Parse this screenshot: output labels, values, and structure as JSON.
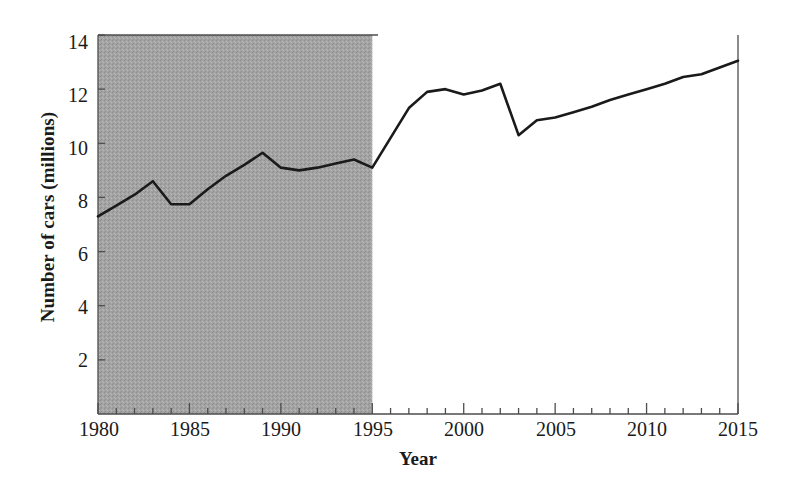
{
  "chart_data": {
    "type": "line",
    "title": "",
    "xlabel": "Year",
    "ylabel": "Number of cars (millions)",
    "xlim": [
      1980,
      2015
    ],
    "ylim": [
      0,
      14
    ],
    "xticks": [
      1980,
      1985,
      1990,
      1995,
      2000,
      2005,
      2010,
      2015
    ],
    "xticklabels": [
      "1980",
      "1985",
      "1990",
      "1995",
      "2000",
      "2005",
      "2010",
      "2015"
    ],
    "xminortick_interval": 1,
    "yticks": [
      2,
      4,
      6,
      8,
      10,
      12,
      14
    ],
    "yticklabels": [
      "2",
      "4",
      "6",
      "8",
      "10",
      "12",
      "14"
    ],
    "grid": false,
    "legend": null,
    "series": [
      {
        "name": "Number of cars",
        "color": "#1a1a1a",
        "linewidth": 2.6,
        "x": [
          1980,
          1981,
          1982,
          1983,
          1984,
          1985,
          1986,
          1987,
          1988,
          1989,
          1990,
          1991,
          1992,
          1993,
          1994,
          1995,
          1996,
          1997,
          1998,
          1999,
          2000,
          2001,
          2002,
          2003,
          2004,
          2005,
          2006,
          2007,
          2008,
          2009,
          2010,
          2011,
          2012,
          2013,
          2014,
          2015
        ],
        "values": [
          7.3,
          7.7,
          8.1,
          8.6,
          7.75,
          7.75,
          8.3,
          8.8,
          9.2,
          9.65,
          9.1,
          9.0,
          9.1,
          9.25,
          9.4,
          9.1,
          10.2,
          11.3,
          11.9,
          12.0,
          11.8,
          11.95,
          12.2,
          10.3,
          10.85,
          10.95,
          11.15,
          11.35,
          11.6,
          11.8,
          12.0,
          12.2,
          12.45,
          12.55,
          12.8,
          13.05
        ]
      }
    ],
    "shaded_region": {
      "label": "",
      "x_start": 1980,
      "x_end": 1995,
      "color": "#9e9e9e"
    },
    "axes_color": "#555555",
    "background": "#ffffff"
  }
}
